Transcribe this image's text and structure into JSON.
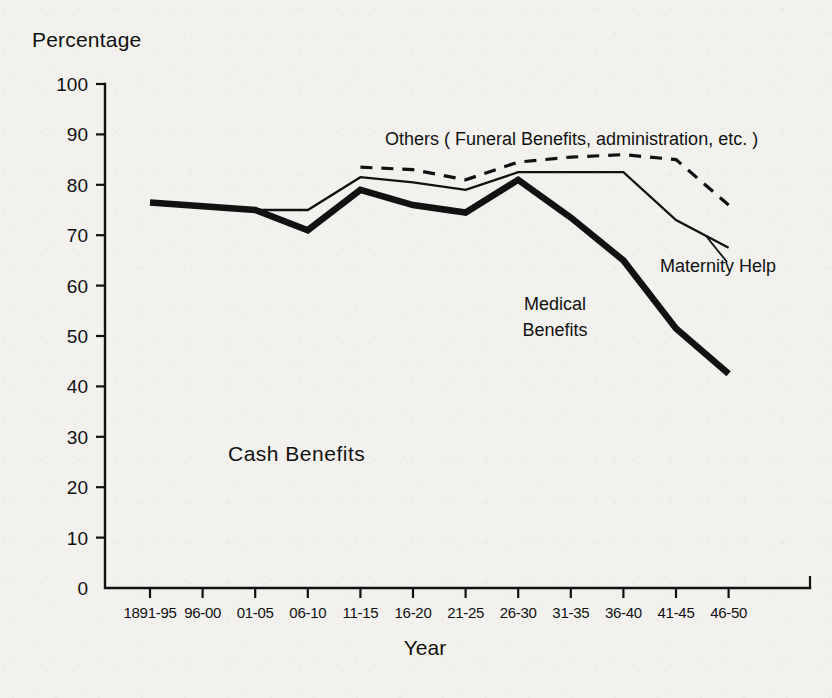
{
  "chart_data": {
    "type": "line",
    "title": "",
    "subtitle": "",
    "xlabel": "Year",
    "ylabel": "Percentage",
    "ylim": [
      0,
      100
    ],
    "yticks": [
      0,
      10,
      20,
      30,
      40,
      50,
      60,
      70,
      80,
      90,
      100
    ],
    "grid": false,
    "legend_position": "inline-annotations",
    "categories": [
      "1891-95",
      "96-00",
      "01-05",
      "06-10",
      "11-15",
      "16-20",
      "21-25",
      "26-30",
      "31-35",
      "36-40",
      "41-45",
      "46-50"
    ],
    "series": [
      {
        "name": "Cash Benefits",
        "style": "thick-solid",
        "values": [
          76.5,
          null,
          75.0,
          71.0,
          79.0,
          76.0,
          74.5,
          81.0,
          73.5,
          65.0,
          51.5,
          42.5
        ],
        "x_start_index": 0
      },
      {
        "name": "Maternity Help",
        "style": "thin-solid",
        "values": [
          null,
          null,
          75.0,
          75.0,
          81.5,
          80.5,
          79.0,
          82.5,
          82.5,
          82.5,
          73.0,
          67.5
        ],
        "x_start_index": 2
      },
      {
        "name": "Others ( Funeral Benefits, administration, etc. )",
        "style": "dashed",
        "values": [
          null,
          null,
          null,
          null,
          83.5,
          83.0,
          81.0,
          84.5,
          85.5,
          86.0,
          85.0,
          76.0
        ],
        "x_start_index": 4
      }
    ],
    "annotations": [
      {
        "id": "others",
        "text": "Others ( Funeral Benefits, administration, etc. )",
        "x_px": 385,
        "y_px": 145
      },
      {
        "id": "maternity",
        "text": "Maternity Help",
        "x_px": 660,
        "y_px": 272
      },
      {
        "id": "medical_line1",
        "text": "Medical",
        "x_px": 555,
        "y_px": 310
      },
      {
        "id": "medical_line2",
        "text": "Benefits",
        "x_px": 555,
        "y_px": 336
      },
      {
        "id": "cash",
        "text": "Cash  Benefits",
        "x_px": 228,
        "y_px": 461
      }
    ]
  },
  "axes": {
    "y_title": "Percentage",
    "x_title": "Year",
    "y_tick_labels": [
      "0",
      "10",
      "20",
      "30",
      "40",
      "50",
      "60",
      "70",
      "80",
      "90",
      "100"
    ],
    "x_tick_labels": [
      "1891-95",
      "96-00",
      "01-05",
      "06-10",
      "11-15",
      "16-20",
      "21-25",
      "26-30",
      "31-35",
      "36-40",
      "41-45",
      "46-50"
    ]
  },
  "colors": {
    "background": "#f2f1ee",
    "ink": "#111111"
  }
}
